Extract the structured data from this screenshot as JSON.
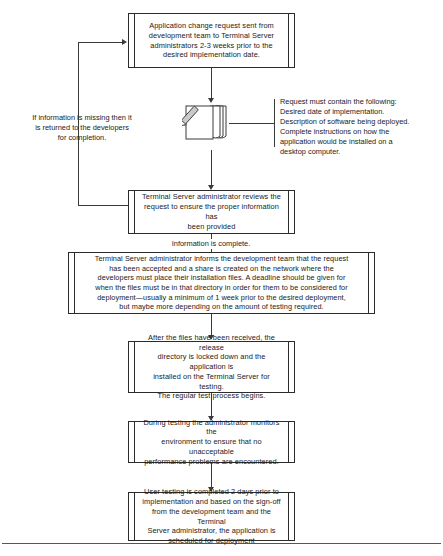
{
  "diagram": {
    "ink_color": "#2b2b2b",
    "background_color": "#ffffff"
  },
  "nodes": [
    {
      "id": "request-sent",
      "shape": "predefined-process",
      "text": "Application change request sent from\ndevelopment team to Terminal Server\nadministrators 2-3 weeks prior to the\ndesired implementation date."
    },
    {
      "id": "admin-reviews",
      "shape": "predefined-process",
      "text": "Terminal Server administrator reviews the\nrequest to ensure the proper information has\nbeen provided"
    },
    {
      "id": "admin-informs",
      "shape": "predefined-process",
      "text": "Terminal Server administrator informs the development team that the request\nhas been accepted and a share is created on the network where the\ndevelopers must place their installation files. A deadline should be given for\nwhen the files must be in that directory in order for them to be considered for\ndeployment—usually a minimum of 1 week prior to the desired deployment,\nbut maybe more depending on the amount of testing required."
    },
    {
      "id": "files-received",
      "shape": "predefined-process",
      "text": "After the files have been received, the release\ndirectory is locked down and the application is\ninstalled on the Terminal Server for testing.\nThe regular test process begins."
    },
    {
      "id": "monitor-testing",
      "shape": "predefined-process",
      "text": "During testing the administrator monitors the\nenvironment to ensure that no unacceptable\nperformance problems are encountered."
    },
    {
      "id": "user-testing",
      "shape": "predefined-process",
      "text": "User testing is completed 2 days prior to\nimplementation and based on the sign-off\nfrom the development team and the Terminal\nServer administrator, the application is\nscheduled for deployment"
    }
  ],
  "annotations": {
    "feedback_note": "If information is missing then it\nis returned to the developers\nfor completion.",
    "document_callout": "Request must contain the following:\nDesired date of implementation.\nDescription of software being deployed.\nComplete instructions on how the\napplication would be installed on a\ndesktop computer.",
    "information_complete": "Information is complete.",
    "document_icon_name": "document-stack-with-pencil"
  }
}
